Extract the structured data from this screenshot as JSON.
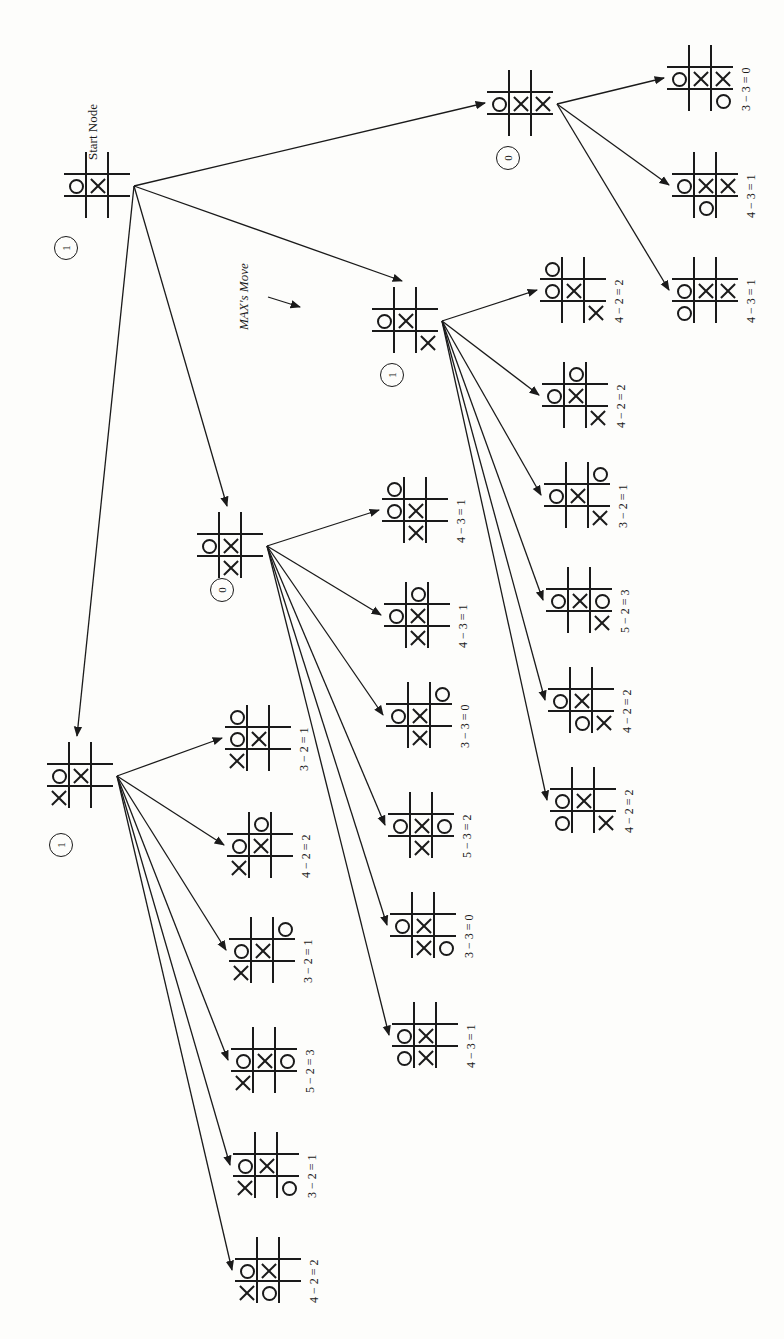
{
  "diagram": {
    "type": "minimax-game-tree",
    "orientation": "rotated-90",
    "start_label": "Start Node",
    "max_move_label": "MAX's Move",
    "nodes": [
      {
        "id": "start",
        "x": 64,
        "y": 152,
        "value": "1",
        "vx": 54,
        "vy": 236,
        "board": [
          [
            "",
            "",
            ""
          ],
          [
            "O",
            "X",
            ""
          ],
          [
            "",
            "",
            ""
          ]
        ]
      },
      {
        "id": "n_right",
        "x": 487,
        "y": 70,
        "value": "0",
        "vx": 496,
        "vy": 146,
        "board": [
          [
            "",
            "",
            ""
          ],
          [
            "O",
            "X",
            "X"
          ],
          [
            "",
            "",
            ""
          ]
        ]
      },
      {
        "id": "n_max",
        "x": 372,
        "y": 287,
        "value": "1",
        "vx": 380,
        "vy": 363,
        "board": [
          [
            "",
            "",
            ""
          ],
          [
            "O",
            "X",
            ""
          ],
          [
            "",
            "",
            "X"
          ]
        ]
      },
      {
        "id": "n_mid",
        "x": 197,
        "y": 512,
        "value": "0",
        "vx": 210,
        "vy": 578,
        "board": [
          [
            "",
            "",
            ""
          ],
          [
            "O",
            "X",
            ""
          ],
          [
            "",
            "X",
            ""
          ]
        ]
      },
      {
        "id": "n_left",
        "x": 47,
        "y": 742,
        "value": "1",
        "vx": 49,
        "vy": 833,
        "board": [
          [
            "",
            "",
            ""
          ],
          [
            "O",
            "X",
            ""
          ],
          [
            "X",
            "",
            ""
          ]
        ]
      }
    ],
    "leaves": [
      {
        "parent": "n_right",
        "x": 667,
        "y": 45,
        "label": "3 − 3 = 0",
        "board": [
          [
            "",
            "",
            ""
          ],
          [
            "O",
            "X",
            "X"
          ],
          [
            "",
            "",
            "O"
          ]
        ]
      },
      {
        "parent": "n_right",
        "x": 672,
        "y": 152,
        "label": "4 − 3 = 1",
        "board": [
          [
            "",
            "",
            ""
          ],
          [
            "O",
            "X",
            "X"
          ],
          [
            "",
            "O",
            ""
          ]
        ]
      },
      {
        "parent": "n_right",
        "x": 672,
        "y": 257,
        "label": "4 − 3 = 1",
        "board": [
          [
            "",
            "",
            ""
          ],
          [
            "O",
            "X",
            "X"
          ],
          [
            "O",
            "",
            ""
          ]
        ]
      },
      {
        "parent": "n_max",
        "x": 540,
        "y": 257,
        "label": "4 − 2 = 2",
        "board": [
          [
            "O",
            "",
            ""
          ],
          [
            "O",
            "X",
            ""
          ],
          [
            "",
            "",
            "X"
          ]
        ]
      },
      {
        "parent": "n_max",
        "x": 542,
        "y": 362,
        "label": "4 − 2 = 2",
        "board": [
          [
            "",
            "O",
            ""
          ],
          [
            "O",
            "X",
            ""
          ],
          [
            "",
            "",
            "X"
          ]
        ]
      },
      {
        "parent": "n_max",
        "x": 544,
        "y": 462,
        "label": "3 − 2 = 1",
        "board": [
          [
            "",
            "",
            "O"
          ],
          [
            "O",
            "X",
            ""
          ],
          [
            "",
            "",
            "X"
          ]
        ]
      },
      {
        "parent": "n_max",
        "x": 546,
        "y": 567,
        "label": "5 − 2 = 3",
        "board": [
          [
            "",
            "",
            ""
          ],
          [
            "O",
            "X",
            "O"
          ],
          [
            "",
            "",
            "X"
          ]
        ]
      },
      {
        "parent": "n_max",
        "x": 548,
        "y": 667,
        "label": "4 − 2 = 2",
        "board": [
          [
            "",
            "",
            ""
          ],
          [
            "O",
            "X",
            ""
          ],
          [
            "",
            "O",
            "X"
          ]
        ]
      },
      {
        "parent": "n_max",
        "x": 550,
        "y": 767,
        "label": "4 − 2 = 2",
        "board": [
          [
            "",
            "",
            ""
          ],
          [
            "O",
            "X",
            ""
          ],
          [
            "O",
            "",
            "X"
          ]
        ]
      },
      {
        "parent": "n_mid",
        "x": 382,
        "y": 477,
        "label": "4 − 3 = 1",
        "board": [
          [
            "O",
            "",
            ""
          ],
          [
            "O",
            "X",
            ""
          ],
          [
            "",
            "X",
            ""
          ]
        ]
      },
      {
        "parent": "n_mid",
        "x": 384,
        "y": 582,
        "label": "4 − 3 = 1",
        "board": [
          [
            "",
            "O",
            ""
          ],
          [
            "O",
            "X",
            ""
          ],
          [
            "",
            "X",
            ""
          ]
        ]
      },
      {
        "parent": "n_mid",
        "x": 386,
        "y": 682,
        "label": "3 − 3 = 0",
        "board": [
          [
            "",
            "",
            "O"
          ],
          [
            "O",
            "X",
            ""
          ],
          [
            "",
            "X",
            ""
          ]
        ]
      },
      {
        "parent": "n_mid",
        "x": 388,
        "y": 792,
        "label": "5 − 3 = 2",
        "board": [
          [
            "",
            "",
            ""
          ],
          [
            "O",
            "X",
            "O"
          ],
          [
            "",
            "X",
            ""
          ]
        ]
      },
      {
        "parent": "n_mid",
        "x": 390,
        "y": 892,
        "label": "3 − 3 = 0",
        "board": [
          [
            "",
            "",
            ""
          ],
          [
            "O",
            "X",
            ""
          ],
          [
            "",
            "X",
            "O"
          ]
        ]
      },
      {
        "parent": "n_mid",
        "x": 392,
        "y": 1002,
        "label": "4 − 3 = 1",
        "board": [
          [
            "",
            "",
            ""
          ],
          [
            "O",
            "X",
            ""
          ],
          [
            "O",
            "X",
            ""
          ]
        ]
      },
      {
        "parent": "n_left",
        "x": 225,
        "y": 705,
        "label": "3 − 2 = 1",
        "board": [
          [
            "O",
            "",
            ""
          ],
          [
            "O",
            "X",
            ""
          ],
          [
            "X",
            "",
            ""
          ]
        ]
      },
      {
        "parent": "n_left",
        "x": 227,
        "y": 812,
        "label": "4 − 2 = 2",
        "board": [
          [
            "",
            "O",
            ""
          ],
          [
            "O",
            "X",
            ""
          ],
          [
            "X",
            "",
            ""
          ]
        ]
      },
      {
        "parent": "n_left",
        "x": 229,
        "y": 917,
        "label": "3 − 2 = 1",
        "board": [
          [
            "",
            "",
            "O"
          ],
          [
            "O",
            "X",
            ""
          ],
          [
            "X",
            "",
            ""
          ]
        ]
      },
      {
        "parent": "n_left",
        "x": 231,
        "y": 1027,
        "label": "5 − 2 = 3",
        "board": [
          [
            "",
            "",
            ""
          ],
          [
            "O",
            "X",
            "O"
          ],
          [
            "X",
            "",
            ""
          ]
        ]
      },
      {
        "parent": "n_left",
        "x": 233,
        "y": 1132,
        "label": "3 − 2 = 1",
        "board": [
          [
            "",
            "",
            ""
          ],
          [
            "O",
            "X",
            ""
          ],
          [
            "X",
            "",
            "O"
          ]
        ]
      },
      {
        "parent": "n_left",
        "x": 235,
        "y": 1237,
        "label": "4 − 2 = 2",
        "board": [
          [
            "",
            "",
            ""
          ],
          [
            "O",
            "X",
            ""
          ],
          [
            "X",
            "O",
            ""
          ]
        ]
      }
    ]
  }
}
